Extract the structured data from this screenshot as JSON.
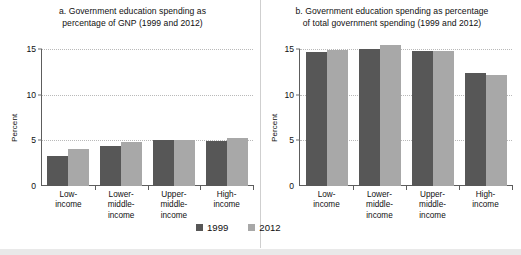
{
  "chart_data": [
    {
      "type": "bar",
      "panel": "a",
      "title": "a. Government education spending as percentage of GNP (1999 and 2012)",
      "title_lines": [
        "a. Government education spending as",
        "percentage of GNP (1999 and 2012)"
      ],
      "xlabel": "",
      "ylabel": "Percent",
      "ylim": [
        0,
        15
      ],
      "yticks": [
        0,
        5,
        10,
        15
      ],
      "ytick_labels": [
        "0",
        "5",
        "10",
        "15"
      ],
      "grid": true,
      "legend_position": "bottom-center",
      "categories": [
        "Low-income",
        "Lower-middle-income",
        "Upper-middle-income",
        "High-income"
      ],
      "category_lines": [
        [
          "Low-",
          "income"
        ],
        [
          "Lower-",
          "middle-",
          "income"
        ],
        [
          "Upper-",
          "middle-",
          "income"
        ],
        [
          "High-",
          "income"
        ]
      ],
      "series": [
        {
          "name": "1999",
          "color": "#575757",
          "values": [
            3.3,
            4.4,
            5.0,
            4.9
          ]
        },
        {
          "name": "2012",
          "color": "#a8a8a8",
          "values": [
            4.1,
            4.8,
            5.0,
            5.3
          ]
        }
      ]
    },
    {
      "type": "bar",
      "panel": "b",
      "title": "b. Government education spending as percentage of total government spending (1999 and 2012)",
      "title_lines": [
        "b. Government education spending as percentage",
        "of total government spending (1999 and 2012)"
      ],
      "xlabel": "",
      "ylabel": "Percent",
      "ylim": [
        0,
        15
      ],
      "yticks": [
        0,
        5,
        10,
        15
      ],
      "ytick_labels": [
        "0",
        "5",
        "10",
        "15"
      ],
      "grid": true,
      "legend_position": "bottom-center",
      "categories": [
        "Low-income",
        "Lower-middle-income",
        "Upper-middle-income",
        "High-income"
      ],
      "category_lines": [
        [
          "Low-",
          "income"
        ],
        [
          "Lower-",
          "middle-",
          "income"
        ],
        [
          "Upper-",
          "middle-",
          "income"
        ],
        [
          "High-",
          "income"
        ]
      ],
      "series": [
        {
          "name": "1999",
          "color": "#575757",
          "values": [
            14.7,
            15.0,
            14.8,
            12.4
          ]
        },
        {
          "name": "2012",
          "color": "#a8a8a8",
          "values": [
            14.9,
            15.4,
            14.8,
            12.2
          ]
        }
      ]
    }
  ],
  "legend": {
    "items": [
      {
        "label": "1999",
        "color": "#575757"
      },
      {
        "label": "2012",
        "color": "#a8a8a8"
      }
    ]
  },
  "colors": {
    "series_1999": "#575757",
    "series_2012": "#a8a8a8",
    "axis": "#5d5d5d",
    "gridline": "#b9b9b9",
    "text": "#101010",
    "background": "#ffffff"
  }
}
